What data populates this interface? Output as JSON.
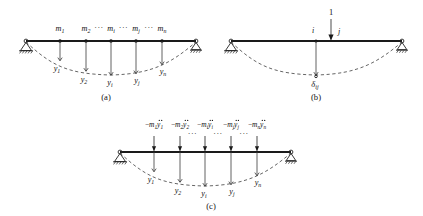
{
  "figure": {
    "background_color": "#ffffff",
    "ink_color": "#111111",
    "panels": [
      {
        "id": "a",
        "caption": "(a)",
        "description": "simply supported beam with lumped masses and deflected shape",
        "left_support": "pinned-support",
        "right_support": "roller-support",
        "mass_labels": [
          "m",
          "m",
          "m",
          "m",
          "m"
        ],
        "mass_subscripts": [
          "1",
          "2",
          "i",
          "j",
          "n"
        ],
        "displacement_labels": [
          "y",
          "y",
          "y",
          "y",
          "y"
        ],
        "displacement_subscripts": [
          "1",
          "2",
          "i",
          "j",
          "n"
        ],
        "ellipses": [
          "···",
          "···",
          "···"
        ]
      },
      {
        "id": "b",
        "caption": "(b)",
        "description": "unit load applied at point j producing deflection delta ij at point i",
        "left_support": "pinned-support",
        "right_support": "roller-support",
        "unit_load_label": "1",
        "point_i_label": "i",
        "point_j_label": "j",
        "deflection_symbol": "δ",
        "deflection_subscript": "ij"
      },
      {
        "id": "c",
        "caption": "(c)",
        "description": "beam loaded by inertial forces negative mass times acceleration",
        "left_support": "pinned-support",
        "right_support": "roller-support",
        "force_labels": [
          "−m₁ÿ₁",
          "−m₂ÿ₂",
          "−mᵢÿᵢ",
          "−mⱼÿⱼ",
          "−mₙÿₙ"
        ],
        "force_parts": [
          {
            "sign": "−",
            "mass": "m",
            "mass_sub": "1",
            "accel": "y",
            "accel_sub": "1"
          },
          {
            "sign": "−",
            "mass": "m",
            "mass_sub": "2",
            "accel": "y",
            "accel_sub": "2"
          },
          {
            "sign": "−",
            "mass": "m",
            "mass_sub": "i",
            "accel": "y",
            "accel_sub": "i"
          },
          {
            "sign": "−",
            "mass": "m",
            "mass_sub": "j",
            "accel": "y",
            "accel_sub": "j"
          },
          {
            "sign": "−",
            "mass": "m",
            "mass_sub": "n",
            "accel": "y",
            "accel_sub": "n"
          }
        ],
        "displacement_labels": [
          "y",
          "y",
          "y",
          "y",
          "y"
        ],
        "displacement_subscripts": [
          "1",
          "2",
          "i",
          "j",
          "n"
        ],
        "ellipses": [
          "···",
          "···",
          "···"
        ]
      }
    ]
  }
}
